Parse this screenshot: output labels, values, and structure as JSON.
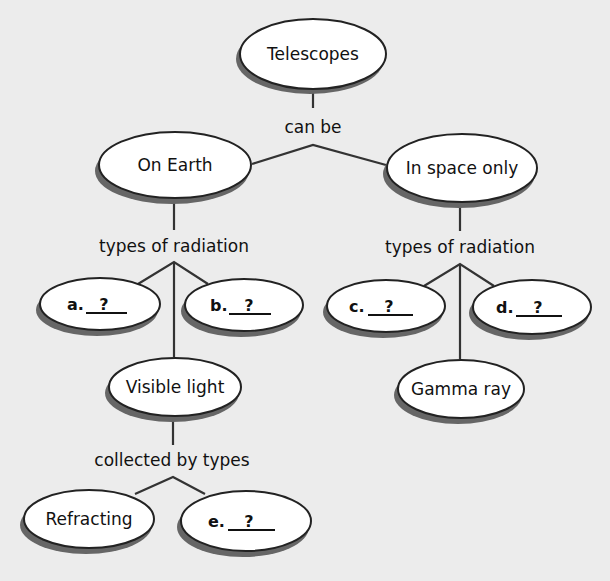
{
  "nodes": {
    "telescopes": {
      "label": "Telescopes"
    },
    "on_earth": {
      "label": "On Earth"
    },
    "in_space": {
      "label": "In space only"
    },
    "a": {
      "prefix": "a.",
      "blank": "?"
    },
    "b": {
      "prefix": "b.",
      "blank": "?"
    },
    "c": {
      "prefix": "c.",
      "blank": "?"
    },
    "d": {
      "prefix": "d.",
      "blank": "?"
    },
    "visible_light": {
      "label": "Visible light"
    },
    "gamma_ray": {
      "label": "Gamma ray"
    },
    "refracting": {
      "label": "Refracting"
    },
    "e": {
      "prefix": "e.",
      "blank": "?"
    }
  },
  "links": {
    "can_be": "can be",
    "types_left": "types of radiation",
    "types_right": "types of radiation",
    "collected_by": "collected by types"
  },
  "colors": {
    "background": "#ececec",
    "node_fill": "#ffffff",
    "node_stroke": "#222222",
    "shadow": "#666666"
  }
}
